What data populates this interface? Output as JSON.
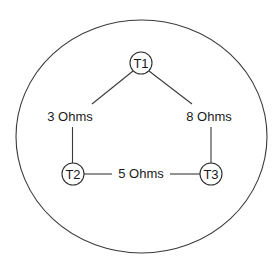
{
  "diagram": {
    "type": "network-graph",
    "boundary": {
      "shape": "ellipse",
      "cx": 141.5,
      "cy": 136.5,
      "rx": 125.5,
      "ry": 116.5
    },
    "nodes": [
      {
        "id": "T1",
        "label": "T1",
        "cx": 141,
        "cy": 63,
        "r": 11
      },
      {
        "id": "T2",
        "label": "T2",
        "cx": 73,
        "cy": 174,
        "r": 11
      },
      {
        "id": "T3",
        "label": "T3",
        "cx": 211,
        "cy": 174,
        "r": 11
      }
    ],
    "edges": [
      {
        "from": "T1",
        "to": "T2",
        "label": "3 Ohms",
        "resistance_ohms": 3
      },
      {
        "from": "T1",
        "to": "T3",
        "label": "8 Ohms",
        "resistance_ohms": 8
      },
      {
        "from": "T2",
        "to": "T3",
        "label": "5 Ohms",
        "resistance_ohms": 5
      }
    ],
    "colors": {
      "stroke": "#3a3a3a",
      "text": "#1a1a1a",
      "background": "#ffffff"
    }
  }
}
